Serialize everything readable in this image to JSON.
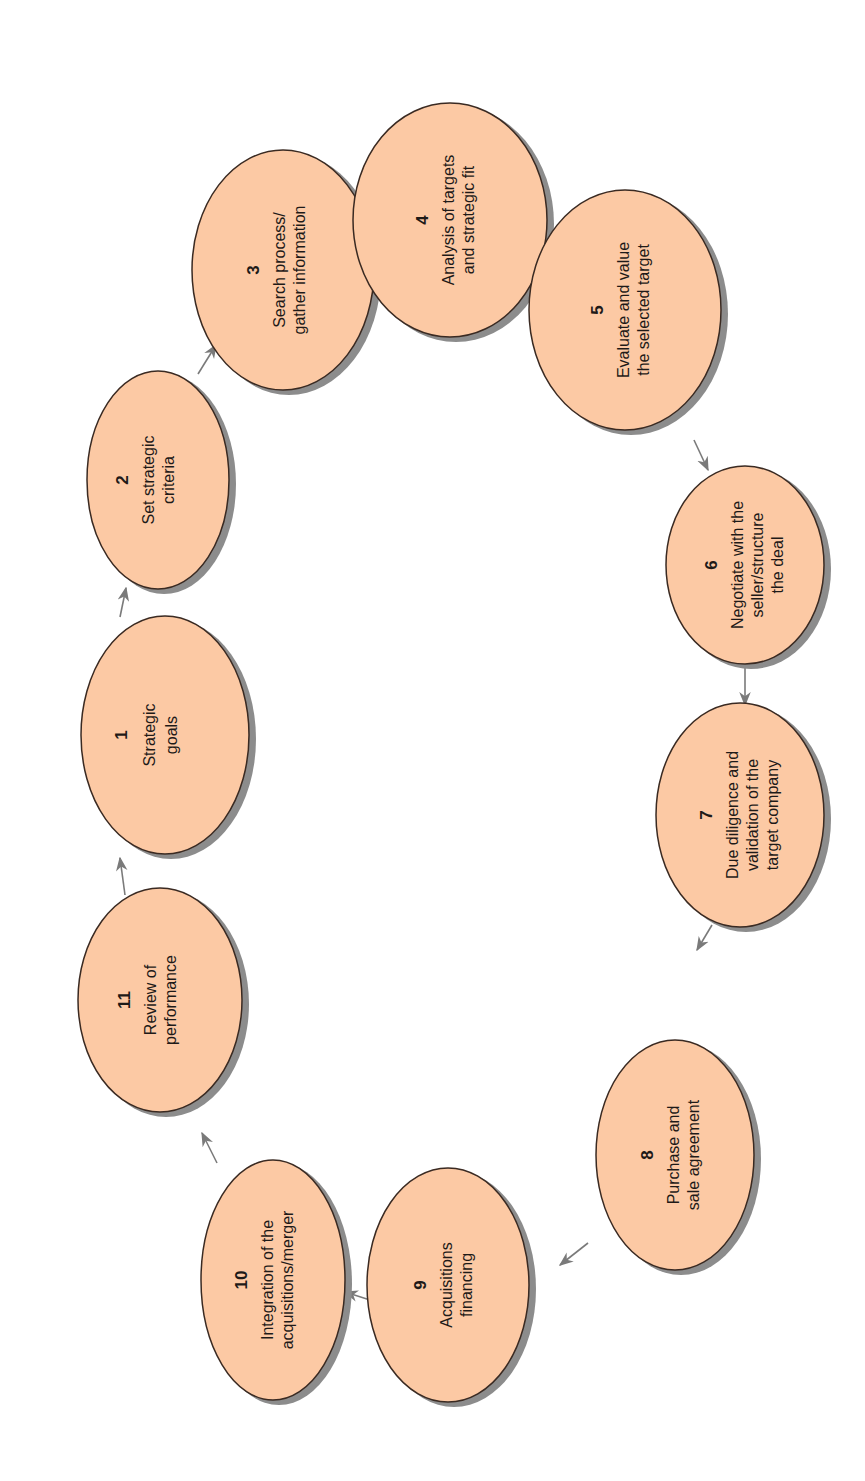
{
  "diagram": {
    "type": "cycle",
    "orientation": "rotated-90-ccw",
    "colors": {
      "node_fill": "#fcc9a4",
      "node_stroke": "#3a2a22",
      "shadow": "#8c8c8c",
      "arrow": "#7a7a7a"
    },
    "nodes": [
      {
        "id": 1,
        "number": "1",
        "lines": [
          "Strategic",
          "goals"
        ]
      },
      {
        "id": 2,
        "number": "2",
        "lines": [
          "Set strategic",
          "criteria"
        ]
      },
      {
        "id": 3,
        "number": "3",
        "lines": [
          "Search process/",
          "gather information"
        ]
      },
      {
        "id": 4,
        "number": "4",
        "lines": [
          "Analysis of targets",
          "and strategic fit"
        ]
      },
      {
        "id": 5,
        "number": "5",
        "lines": [
          "Evaluate and value",
          "the selected target"
        ]
      },
      {
        "id": 6,
        "number": "6",
        "lines": [
          "Negotiate with the",
          "seller/structure",
          "the deal"
        ]
      },
      {
        "id": 7,
        "number": "7",
        "lines": [
          "Due diligence and",
          "validation of the",
          "target company"
        ]
      },
      {
        "id": 8,
        "number": "8",
        "lines": [
          "Purchase and",
          "sale agreement"
        ]
      },
      {
        "id": 9,
        "number": "9",
        "lines": [
          "Acquisitions",
          "financing"
        ]
      },
      {
        "id": 10,
        "number": "10",
        "lines": [
          "Integration of the",
          "acquisitions/merger"
        ]
      },
      {
        "id": 11,
        "number": "11",
        "lines": [
          "Review of",
          "performance"
        ]
      }
    ],
    "edges": [
      {
        "from": 1,
        "to": 2
      },
      {
        "from": 2,
        "to": 3
      },
      {
        "from": 3,
        "to": 4
      },
      {
        "from": 4,
        "to": 5
      },
      {
        "from": 5,
        "to": 6
      },
      {
        "from": 6,
        "to": 7
      },
      {
        "from": 7,
        "to": 8
      },
      {
        "from": 8,
        "to": 9
      },
      {
        "from": 9,
        "to": 10
      },
      {
        "from": 10,
        "to": 11
      },
      {
        "from": 11,
        "to": 1
      }
    ]
  }
}
